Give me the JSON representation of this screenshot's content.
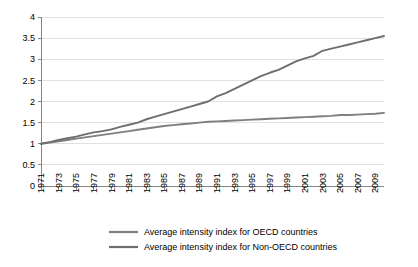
{
  "chart_data": {
    "type": "line",
    "title": "",
    "subtitle": "",
    "xlabel": "",
    "ylabel": "",
    "grid": true,
    "legend_position": "bottom",
    "xlim": [
      1971,
      2010
    ],
    "ylim": [
      0,
      4
    ],
    "ytick_labels": [
      "0",
      "0.5",
      "1",
      "1.5",
      "2",
      "2.5",
      "3",
      "3.5",
      "4"
    ],
    "ytick_values": [
      0,
      0.5,
      1,
      1.5,
      2,
      2.5,
      3,
      3.5,
      4
    ],
    "xtick_labels": [
      "1971",
      "1973",
      "1975",
      "1977",
      "1979",
      "1981",
      "1983",
      "1985",
      "1987",
      "1989",
      "1991",
      "1993",
      "1995",
      "1997",
      "1999",
      "2001",
      "2003",
      "2005",
      "2007",
      "2009"
    ],
    "x": [
      1971,
      1972,
      1973,
      1974,
      1975,
      1976,
      1977,
      1978,
      1979,
      1980,
      1981,
      1982,
      1983,
      1984,
      1985,
      1986,
      1987,
      1988,
      1989,
      1990,
      1991,
      1992,
      1993,
      1994,
      1995,
      1996,
      1997,
      1998,
      1999,
      2000,
      2001,
      2002,
      2003,
      2004,
      2005,
      2006,
      2007,
      2008,
      2009,
      2010
    ],
    "series": [
      {
        "name": "Average intensity index for OECD countries",
        "color": "#7f7f7f",
        "values": [
          1.0,
          1.03,
          1.06,
          1.09,
          1.12,
          1.15,
          1.18,
          1.21,
          1.24,
          1.27,
          1.3,
          1.33,
          1.36,
          1.39,
          1.42,
          1.44,
          1.46,
          1.48,
          1.5,
          1.52,
          1.53,
          1.54,
          1.55,
          1.56,
          1.57,
          1.58,
          1.59,
          1.6,
          1.61,
          1.62,
          1.63,
          1.64,
          1.65,
          1.66,
          1.68,
          1.68,
          1.69,
          1.7,
          1.71,
          1.73
        ]
      },
      {
        "name": "Average intensity index for Non-OECD countries",
        "color": "#6e6e6e",
        "values": [
          1.0,
          1.04,
          1.09,
          1.13,
          1.17,
          1.22,
          1.27,
          1.3,
          1.34,
          1.4,
          1.45,
          1.5,
          1.58,
          1.64,
          1.7,
          1.76,
          1.82,
          1.88,
          1.94,
          2.0,
          2.12,
          2.2,
          2.3,
          2.4,
          2.5,
          2.6,
          2.68,
          2.75,
          2.85,
          2.95,
          3.02,
          3.08,
          3.2,
          3.25,
          3.3,
          3.35,
          3.4,
          3.45,
          3.5,
          3.55
        ]
      }
    ]
  },
  "legend": {
    "items": [
      {
        "label": "Average intensity index for OECD countries"
      },
      {
        "label": "Average intensity index for Non-OECD countries"
      }
    ]
  }
}
